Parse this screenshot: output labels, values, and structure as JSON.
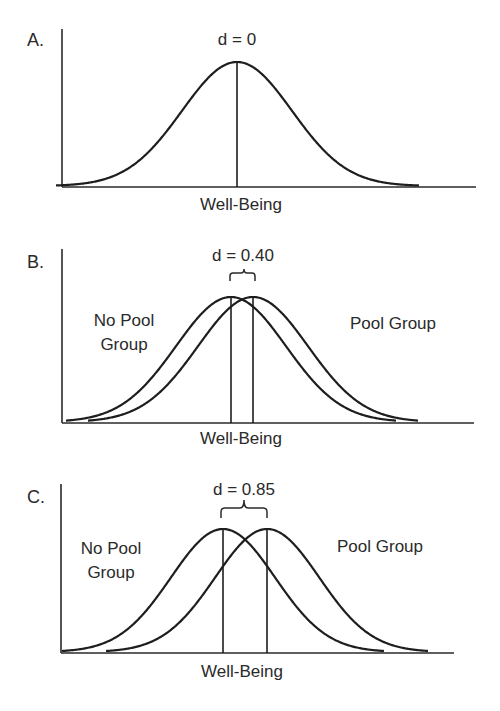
{
  "colors": {
    "ink": "#1e1e1e",
    "background": "#ffffff"
  },
  "panels": [
    {
      "label": "A.",
      "effect_label": "d = 0",
      "xlabel": "Well-Being",
      "left_group": "",
      "left_group_line2": "",
      "right_group": ""
    },
    {
      "label": "B.",
      "effect_label": "d = 0.40",
      "xlabel": "Well-Being",
      "left_group": "No Pool",
      "left_group_line2": "Group",
      "right_group": "Pool Group"
    },
    {
      "label": "C.",
      "effect_label": "d = 0.85",
      "xlabel": "Well-Being",
      "left_group": "No Pool",
      "left_group_line2": "Group",
      "right_group": "Pool Group"
    }
  ],
  "chart_data": [
    {
      "type": "line",
      "title": "A. d = 0",
      "xlabel": "Well-Being",
      "ylabel": "",
      "effect_size_d": 0,
      "series": [
        {
          "name": "Distribution",
          "mean": 0,
          "sd": 1
        }
      ],
      "grid": false
    },
    {
      "type": "line",
      "title": "B. d = 0.40",
      "xlabel": "Well-Being",
      "ylabel": "",
      "effect_size_d": 0.4,
      "series": [
        {
          "name": "No Pool Group",
          "mean": 0,
          "sd": 1
        },
        {
          "name": "Pool Group",
          "mean": 0.4,
          "sd": 1
        }
      ],
      "grid": false
    },
    {
      "type": "line",
      "title": "C. d = 0.85",
      "xlabel": "Well-Being",
      "ylabel": "",
      "effect_size_d": 0.85,
      "series": [
        {
          "name": "No Pool Group",
          "mean": 0,
          "sd": 1
        },
        {
          "name": "Pool Group",
          "mean": 0.85,
          "sd": 1
        }
      ],
      "grid": false
    }
  ]
}
